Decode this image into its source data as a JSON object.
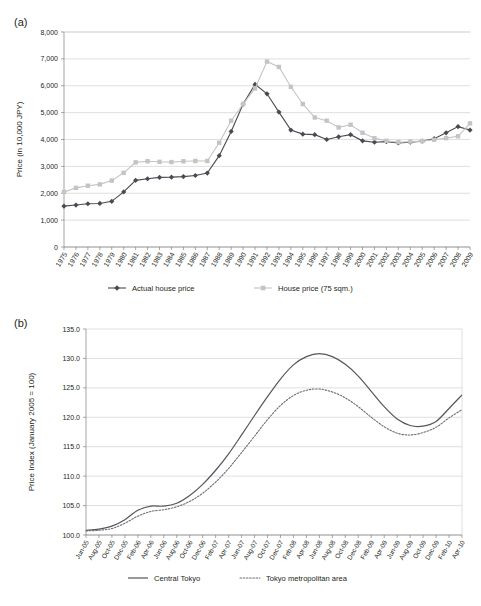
{
  "figure_a": {
    "panel_label": "(a)",
    "ylabel": "Price (in 10,000 JPY)",
    "legend": [
      {
        "label": "Actual house price",
        "color": "#4a4a52",
        "marker": "diamond"
      },
      {
        "label": "House price (75 sqm.)",
        "color": "#c4c4c4",
        "marker": "square"
      }
    ]
  },
  "figure_b": {
    "panel_label": "(b)",
    "ylabel": "Price Index (January 2005 = 100)",
    "legend": [
      {
        "label": "Central Tokyo",
        "color": "#55555d",
        "style": "solid"
      },
      {
        "label": "Tokyo metropolitan area",
        "color": "#6d6d75",
        "style": "dotted"
      }
    ]
  },
  "chart_data": [
    {
      "type": "line",
      "id": "panel-a",
      "title": "",
      "xlabel": "",
      "ylabel": "Price (in 10,000 JPY)",
      "ylim": [
        0,
        8000
      ],
      "yticks": [
        0,
        1000,
        2000,
        3000,
        4000,
        5000,
        6000,
        7000,
        8000
      ],
      "ytick_labels": [
        "0",
        "1,000",
        "2,000",
        "3,000",
        "4,000",
        "5,000",
        "6,000",
        "7,000",
        "8,000"
      ],
      "grid": true,
      "legend_position": "bottom",
      "categories": [
        "1975",
        "1976",
        "1977",
        "1978",
        "1979",
        "1980",
        "1981",
        "1982",
        "1983",
        "1984",
        "1985",
        "1986",
        "1987",
        "1988",
        "1989",
        "1990",
        "1991",
        "1992",
        "1993",
        "1994",
        "1995",
        "1996",
        "1997",
        "1998",
        "1999",
        "2000",
        "2001",
        "2002",
        "2003",
        "2004",
        "2005",
        "2006",
        "2007",
        "2008",
        "2009"
      ],
      "series": [
        {
          "name": "Actual house price",
          "color": "#4a4a52",
          "marker": "diamond",
          "values": [
            1520,
            1560,
            1610,
            1620,
            1700,
            2050,
            2480,
            2540,
            2590,
            2600,
            2620,
            2660,
            2750,
            3400,
            4300,
            5320,
            6050,
            5700,
            5020,
            4350,
            4200,
            4180,
            4000,
            4100,
            4180,
            3950,
            3900,
            3920,
            3870,
            3900,
            3940,
            4030,
            4250,
            4480,
            4350
          ]
        },
        {
          "name": "House price (75 sqm.)",
          "color": "#c4c4c4",
          "marker": "square",
          "values": [
            2050,
            2200,
            2280,
            2330,
            2470,
            2760,
            3150,
            3190,
            3170,
            3160,
            3190,
            3200,
            3200,
            3880,
            4700,
            5320,
            5900,
            6900,
            6700,
            5960,
            5320,
            4820,
            4700,
            4450,
            4550,
            4250,
            4050,
            3950,
            3900,
            3920,
            3940,
            3990,
            4050,
            4120,
            4600,
            4520
          ]
        }
      ]
    },
    {
      "type": "line",
      "id": "panel-b",
      "title": "",
      "xlabel": "",
      "ylabel": "Price Index (January 2005 = 100)",
      "ylim": [
        100.0,
        135.0
      ],
      "yticks": [
        100.0,
        105.0,
        110.0,
        115.0,
        120.0,
        125.0,
        130.0,
        135.0
      ],
      "ytick_labels": [
        "100.0",
        "105.0",
        "110.0",
        "115.0",
        "120.0",
        "125.0",
        "130.0",
        "135.0"
      ],
      "grid": true,
      "legend_position": "bottom",
      "categories": [
        "Jun-05",
        "Aug-05",
        "Oct-05",
        "Dec-05",
        "Feb-06",
        "Apr-06",
        "Jun-06",
        "Aug-06",
        "Oct-06",
        "Dec-06",
        "Feb-07",
        "Apr-07",
        "Jun-07",
        "Aug-07",
        "Oct-07",
        "Dec-07",
        "Feb-08",
        "Apr-08",
        "Jun-08",
        "Aug-08",
        "Oct-08",
        "Dec-08",
        "Feb-09",
        "Apr-09",
        "Jun-09",
        "Aug-09",
        "Oct-09",
        "Dec-09",
        "Feb-10",
        "Apr-10"
      ],
      "series": [
        {
          "name": "Central Tokyo",
          "color": "#55555d",
          "style": "solid",
          "values": [
            100.8,
            101.0,
            101.5,
            102.6,
            104.2,
            104.9,
            104.9,
            105.4,
            106.7,
            108.6,
            111.0,
            113.8,
            117.0,
            120.3,
            123.5,
            126.5,
            128.9,
            130.3,
            130.8,
            130.3,
            129.0,
            127.0,
            124.4,
            121.8,
            119.7,
            118.6,
            118.5,
            119.3,
            121.5,
            123.8,
            125.2
          ]
        },
        {
          "name": "Tokyo metropolitan area",
          "color": "#6d6d75",
          "style": "dotted",
          "values": [
            100.7,
            100.8,
            101.1,
            102.0,
            103.2,
            104.0,
            104.3,
            104.8,
            105.7,
            107.1,
            109.0,
            111.3,
            114.0,
            116.8,
            119.6,
            122.0,
            123.7,
            124.6,
            124.8,
            124.3,
            123.3,
            121.8,
            120.0,
            118.4,
            117.3,
            117.0,
            117.4,
            118.3,
            119.9,
            121.3,
            121.5
          ]
        }
      ]
    }
  ]
}
